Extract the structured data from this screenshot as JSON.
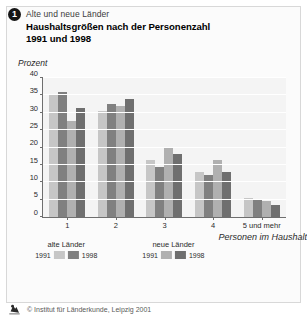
{
  "header": {
    "badge": "1",
    "eyebrow": "Alte und neue Länder",
    "title_main": "Haushaltsgrößen nach der Personenzahl",
    "title_sub": "1991 und 1998"
  },
  "footer": {
    "logo_icon": "institute-logo-icon",
    "credit": "© Institut für Länderkunde, Leipzig 2001"
  },
  "legend": {
    "groups": [
      {
        "caption": "alte Länder",
        "keys": [
          {
            "year": "1991",
            "color": "#c6c6c6"
          },
          {
            "year": "1998",
            "color": "#808080"
          }
        ]
      },
      {
        "caption": "neue Länder",
        "keys": [
          {
            "year": "1991",
            "color": "#b0b0b0"
          },
          {
            "year": "1998",
            "color": "#6f6f6f"
          }
        ]
      }
    ]
  },
  "chart_data": {
    "type": "bar",
    "title": "Haushaltsgrößen nach der Personenzahl 1991 und 1998",
    "subtitle": "Alte und neue Länder",
    "unit_label": "Prozent",
    "xlabel": "Personen im Haushalt",
    "ylabel": "Prozent",
    "ylim": [
      0,
      40
    ],
    "yticks": [
      0,
      5,
      10,
      15,
      20,
      25,
      30,
      35,
      40
    ],
    "grid": true,
    "legend_position": "below",
    "categories": [
      "1",
      "2",
      "3",
      "4",
      "5 und mehr"
    ],
    "series": [
      {
        "name": "alte Länder 1991",
        "color": "#c6c6c6",
        "values": [
          35.0,
          30.5,
          16.5,
          13.0,
          5.5
        ]
      },
      {
        "name": "alte Länder 1998",
        "color": "#808080",
        "values": [
          36.0,
          32.5,
          14.5,
          12.0,
          5.0
        ]
      },
      {
        "name": "neue Länder 1991",
        "color": "#b0b0b0",
        "values": [
          27.5,
          32.0,
          20.0,
          16.5,
          4.5
        ]
      },
      {
        "name": "neue Länder 1998",
        "color": "#6f6f6f",
        "values": [
          31.5,
          34.0,
          18.0,
          13.0,
          3.5
        ]
      }
    ]
  }
}
